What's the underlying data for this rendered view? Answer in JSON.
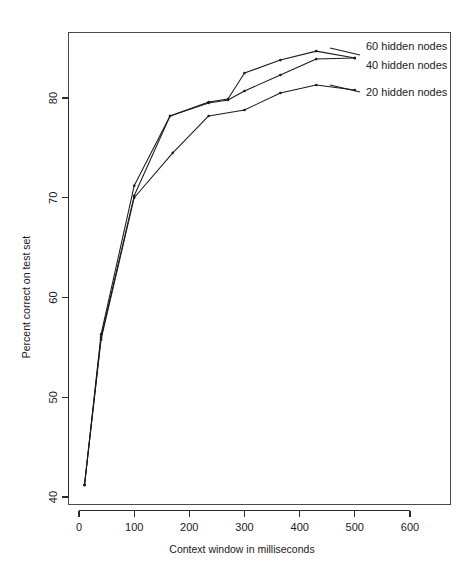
{
  "chart_data": {
    "type": "line",
    "title": "",
    "subtitle": "",
    "xlabel": "Context window in milliseconds",
    "ylabel": "Percent correct on test set",
    "xlim": [
      -15,
      660
    ],
    "ylim": [
      40,
      86
    ],
    "xticks": [
      0,
      100,
      200,
      300,
      400,
      500,
      600
    ],
    "xticklabels": [
      "0",
      "100",
      "200",
      "300",
      "400",
      "500",
      "600"
    ],
    "yticks": [
      40,
      50,
      60,
      70,
      80
    ],
    "yticklabels": [
      "40",
      "50",
      "60",
      "70",
      "80"
    ],
    "grid": false,
    "legend_position": "right-outside",
    "markers": "points",
    "series": [
      {
        "name": "60 hidden nodes",
        "legend_label": "60 hidden nodes",
        "x": [
          10,
          40,
          100,
          165,
          235,
          270,
          300,
          365,
          430,
          500
        ],
        "y": [
          41.2,
          56.3,
          71.2,
          78.2,
          79.6,
          79.9,
          82.5,
          83.8,
          84.7,
          84.0
        ]
      },
      {
        "name": "40 hidden nodes",
        "legend_label": "40 hidden nodes",
        "x": [
          10,
          40,
          100,
          165,
          235,
          270,
          300,
          365,
          430,
          500
        ],
        "y": [
          41.2,
          56.0,
          70.2,
          78.2,
          79.5,
          79.8,
          80.7,
          82.3,
          83.9,
          84.0
        ]
      },
      {
        "name": "20 hidden nodes",
        "legend_label": "20 hidden nodes",
        "x": [
          10,
          40,
          100,
          170,
          235,
          300,
          365,
          430,
          500
        ],
        "y": [
          41.2,
          55.8,
          70.0,
          74.5,
          78.2,
          78.8,
          80.5,
          81.3,
          80.8
        ]
      }
    ],
    "legend_entries": [
      {
        "label": "60 hidden nodes"
      },
      {
        "label": "40 hidden nodes"
      },
      {
        "label": "20 hidden nodes"
      }
    ]
  },
  "colors": {
    "line": "#1a1a1a",
    "axis": "#2b2b2b",
    "panel_border": "#4a4a4a",
    "background": "#ffffff"
  }
}
